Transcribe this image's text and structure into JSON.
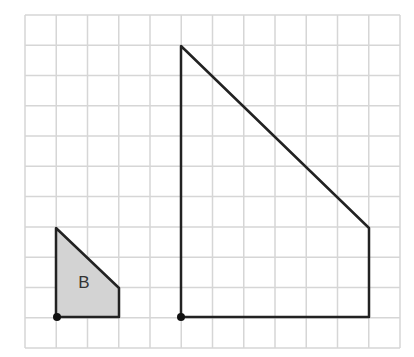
{
  "grid": {
    "x0": 25,
    "y0": 15,
    "cols": 12,
    "rows": 11,
    "cell_w": 31.25,
    "cell_h": 30.27,
    "line_color": "#d6d6d6"
  },
  "shapes": [
    {
      "name": "shape-b",
      "label": "B",
      "fill": "#d3d3d3",
      "stroke": "#222222",
      "points": "56,228 56,317 119,317 119,288",
      "label_x": 84,
      "label_y": 288
    },
    {
      "name": "large-shape",
      "label": "",
      "fill": "none",
      "stroke": "#222222",
      "points": "181,46 181,317 369,317 369,228"
    }
  ],
  "dots": [
    {
      "x": 57,
      "y": 317
    },
    {
      "x": 181,
      "y": 317
    }
  ],
  "labels": {
    "shape_b": "B"
  }
}
